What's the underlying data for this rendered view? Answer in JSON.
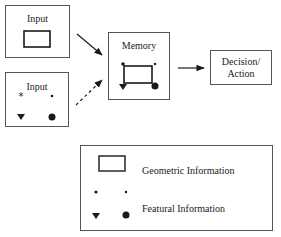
{
  "diagram": {
    "input_geometric": {
      "label": "Input"
    },
    "input_featural": {
      "label": "Input"
    },
    "memory": {
      "label": "Memory"
    },
    "decision": {
      "line1": "Decision/",
      "line2": "Action"
    },
    "arrows": [
      {
        "from": "input_geometric",
        "to": "memory",
        "style": "solid"
      },
      {
        "from": "input_featural",
        "to": "memory",
        "style": "dashed"
      },
      {
        "from": "memory",
        "to": "decision",
        "style": "solid"
      }
    ]
  },
  "legend": {
    "geometric_label": "Geometric Information",
    "featural_label": "Featural Information"
  },
  "colors": {
    "stroke": "#1a1a1a",
    "border": "#555555",
    "background": "#ffffff"
  }
}
